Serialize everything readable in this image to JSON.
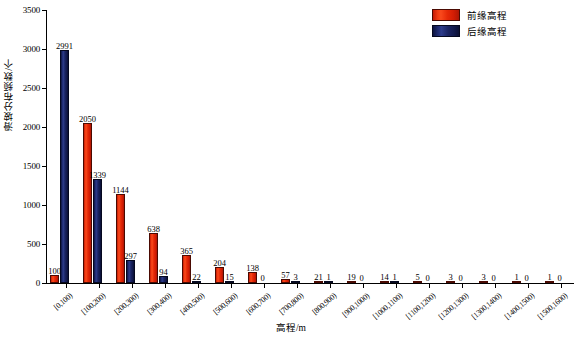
{
  "chart_data": {
    "type": "bar",
    "title": "",
    "xlabel": "高程/m",
    "ylabel": "滑坡分布频数/个",
    "ylim": [
      0,
      3500
    ],
    "yticks": [
      0,
      500,
      1000,
      1500,
      2000,
      2500,
      3000,
      3500
    ],
    "grid": false,
    "legend_position": "top-right",
    "categories": [
      "[0,100)",
      "[100,200)",
      "[200,300)",
      "[300,400)",
      "[400,500)",
      "[500,600)",
      "[600,700)",
      "[700,800)",
      "[800,900)",
      "[900,1000)",
      "[1000,1100)",
      "[1100,1200)",
      "[1200,1300)",
      "[1300,1400)",
      "[1400,1500)",
      "[1500,1600)"
    ],
    "series": [
      {
        "name": "前缘高程",
        "color": "#e62a07",
        "values": [
          100,
          2050,
          1144,
          638,
          365,
          204,
          138,
          57,
          21,
          19,
          14,
          5,
          3,
          3,
          1,
          1
        ]
      },
      {
        "name": "后缘高程",
        "color": "#1a2462",
        "values": [
          2991,
          1339,
          297,
          94,
          22,
          15,
          0,
          3,
          1,
          0,
          1,
          0,
          0,
          0,
          0,
          0
        ]
      }
    ]
  },
  "legend": {
    "items": [
      {
        "label": "前缘高程",
        "color": "#e62a07"
      },
      {
        "label": "后缘高程",
        "color": "#1a2462"
      }
    ]
  },
  "axes": {
    "y_title": "滑坡分布频数/个",
    "x_title": "高程/m"
  }
}
